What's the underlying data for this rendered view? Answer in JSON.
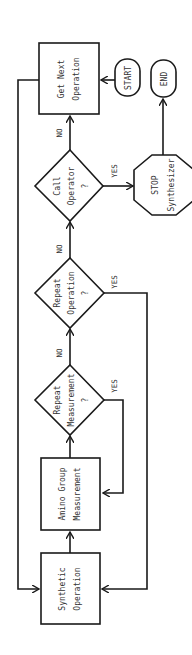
{
  "diagram": {
    "orientation": "rotated-90-ccw",
    "nodes": {
      "get_next": {
        "line1": "Get  Next",
        "line2": "Operation"
      },
      "start": {
        "label": "START"
      },
      "end": {
        "label": "END"
      },
      "call_operator": {
        "line1": "Call",
        "line2": "Operator",
        "line3": "?"
      },
      "stop": {
        "line1": "STOP",
        "line2": "Synthesizer"
      },
      "repeat_operation": {
        "line1": "Repeat",
        "line2": "Operation",
        "line3": "?"
      },
      "repeat_measurement": {
        "line1": "Repeat",
        "line2": "Measurement",
        "line3": "?"
      },
      "amino_group": {
        "line1": "Amino  Group",
        "line2": "Measurement"
      },
      "synthetic": {
        "line1": "Synthetic",
        "line2": "Operation"
      }
    },
    "edge_labels": {
      "no1": "NO",
      "no2": "NO",
      "no3": "NO",
      "yes_call": "YES",
      "yes_repeat_op": "YES",
      "yes_repeat_meas": "YES"
    }
  }
}
